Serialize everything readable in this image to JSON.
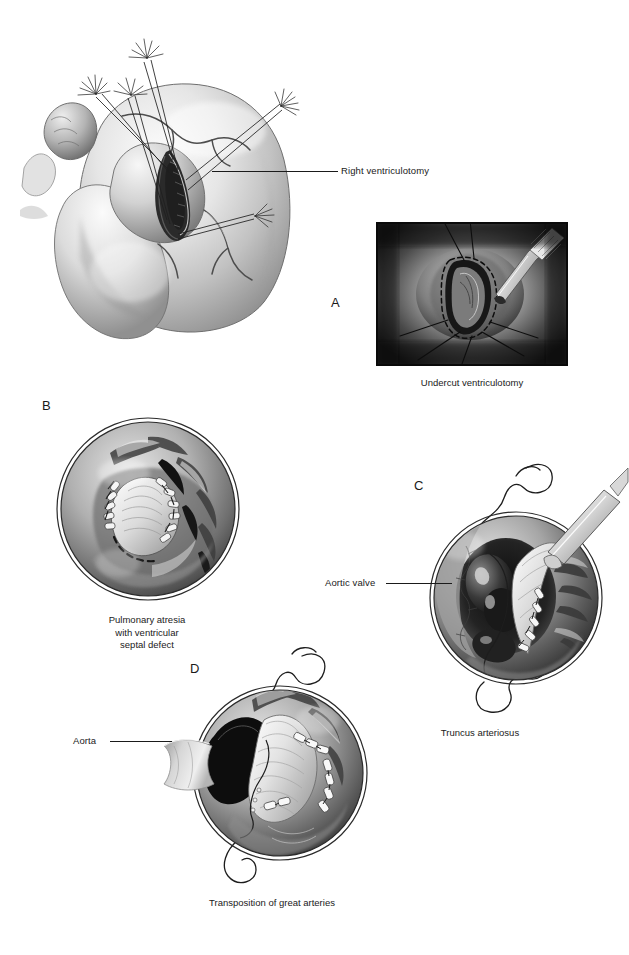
{
  "figure": {
    "medium": "grayscale airbrush medical illustration",
    "background_color": "#ffffff",
    "ink_color": "#1a1a1a"
  },
  "panels": [
    {
      "id": "A",
      "letter": "A",
      "letter_pos": {
        "x": 331,
        "y": 295
      },
      "subject": "anterior view of heart with stay sutures retracting a right ventriculotomy",
      "callouts": [
        {
          "name": "right-ventriculotomy",
          "text": "Right ventriculotomy",
          "text_pos": {
            "x": 341,
            "y": 165
          },
          "leader": {
            "x1": 338,
            "y1": 171,
            "x2": 212,
            "y2": 171
          }
        }
      ],
      "inset": {
        "name": "undercut-ventriculotomy-inset",
        "rect": {
          "x": 376,
          "y": 222,
          "w": 192,
          "h": 144
        },
        "caption": "Undercut ventriculotomy",
        "caption_pos": {
          "x": 472,
          "y": 383
        },
        "contents": "scalpel undercutting the edge of the ventriculotomy, dashed incision outline, radiating stay sutures"
      }
    },
    {
      "id": "B",
      "letter": "B",
      "letter_pos": {
        "x": 42,
        "y": 407
      },
      "circle": {
        "cx": 147,
        "cy": 508,
        "r": 90
      },
      "subject": "intracardiac view, conduit/patch sutured in place",
      "caption": "Pulmonary atresia\nwith ventricular\nseptal defect",
      "caption_pos": {
        "x": 147,
        "y": 620
      },
      "callouts": []
    },
    {
      "id": "C",
      "letter": "C",
      "letter_pos": {
        "x": 414,
        "y": 487
      },
      "circle": {
        "cx": 487,
        "cy": 590,
        "r": 82
      },
      "subject": "intracardiac view with forceps retracting tissue, suture needle and thread looping outside the field",
      "caption": "Truncus arteriosus",
      "caption_pos": {
        "x": 480,
        "y": 733
      },
      "callouts": [
        {
          "name": "aortic-valve",
          "text": "Aortic valve",
          "text_pos": {
            "x": 325,
            "y": 578
          },
          "leader": {
            "x1": 383,
            "y1": 583,
            "x2": 450,
            "y2": 583
          }
        }
      ]
    },
    {
      "id": "D",
      "letter": "D",
      "letter_pos": {
        "x": 190,
        "y": 670
      },
      "circle": {
        "cx": 272,
        "cy": 769,
        "r": 83
      },
      "subject": "intracardiac view of baffle with running suture line, needle and thread looping outside the field",
      "caption": "Transposition of great arteries",
      "caption_pos": {
        "x": 272,
        "y": 903
      },
      "callouts": [
        {
          "name": "aorta",
          "text": "Aorta",
          "text_pos": {
            "x": 73,
            "y": 736
          },
          "leader": {
            "x1": 110,
            "y1": 741,
            "x2": 172,
            "y2": 741
          }
        }
      ]
    }
  ],
  "labels": {
    "right_ventriculotomy": "Right ventriculotomy",
    "undercut_ventriculotomy": "Undercut ventriculotomy",
    "pulmonary_atresia": "Pulmonary atresia\nwith ventricular\nseptal defect",
    "aortic_valve": "Aortic valve",
    "truncus_arteriosus": "Truncus arteriosus",
    "aorta": "Aorta",
    "transposition": "Transposition of great arteries",
    "letter_a": "A",
    "letter_b": "B",
    "letter_c": "C",
    "letter_d": "D"
  },
  "colors": {
    "ink": "#1a1a1a",
    "tissue_light": "#f2f2f2",
    "tissue_mid": "#b9b9b9",
    "tissue_dark": "#5a5a5a",
    "tissue_deep": "#1e1e1e",
    "suture_white": "#fafafa",
    "background": "#ffffff"
  }
}
